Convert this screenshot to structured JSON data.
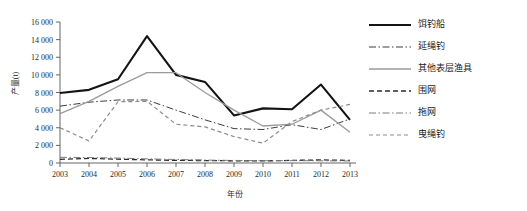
{
  "chart_data": {
    "type": "line",
    "title": "",
    "xlabel": "年份",
    "ylabel": "产量(t)",
    "grid": false,
    "legend_position": "right",
    "xlim": [
      2003,
      2013
    ],
    "ylim": [
      0,
      16000
    ],
    "ytick_step": 2000,
    "categories": [
      "2003",
      "2004",
      "2005",
      "2006",
      "2007",
      "2008",
      "2009",
      "2010",
      "2011",
      "2012",
      "2013"
    ],
    "ytick_labels": [
      "0",
      "2 000",
      "4 000",
      "6 000",
      "8 000",
      "10 000",
      "12 000",
      "14 000",
      "16 000"
    ],
    "series": [
      {
        "name": "饵钓船",
        "style": "solid",
        "color": "#141414",
        "width": 2.1,
        "values": [
          7950,
          8300,
          9500,
          14400,
          10000,
          9200,
          5400,
          6200,
          6100,
          8900,
          4900
        ]
      },
      {
        "name": "延绳钓",
        "style": "dashdot",
        "color": "#3c3c3c",
        "width": 1.0,
        "values": [
          6450,
          6900,
          7150,
          7150,
          6000,
          4900,
          3900,
          3800,
          4350,
          3800,
          5000
        ]
      },
      {
        "name": "其他表层渔具",
        "style": "solid",
        "color": "#9a9a9a",
        "width": 1.3,
        "values": [
          5600,
          7000,
          8700,
          10250,
          10250,
          8000,
          6000,
          4200,
          4400,
          6000,
          3500
        ]
      },
      {
        "name": "围网",
        "style": "dashed",
        "color": "#2b2b2b",
        "width": 1.3,
        "values": [
          420,
          520,
          430,
          360,
          300,
          280,
          250,
          230,
          300,
          350,
          300
        ]
      },
      {
        "name": "拖网",
        "style": "dashdot",
        "color": "#7d7d7d",
        "width": 1.0,
        "values": [
          640,
          620,
          560,
          470,
          400,
          330,
          290,
          260,
          270,
          250,
          230
        ]
      },
      {
        "name": "曳绳钓",
        "style": "dashed-light",
        "color": "#8c8c8c",
        "width": 1.2,
        "values": [
          4000,
          2500,
          6950,
          7000,
          4400,
          4100,
          3000,
          2250,
          4700,
          6000,
          6650
        ]
      }
    ]
  },
  "legend": {
    "items": [
      {
        "label": "饵钓船"
      },
      {
        "label": "延绳钓"
      },
      {
        "label": "其他表层渔具"
      },
      {
        "label": "围网"
      },
      {
        "label": "拖网"
      },
      {
        "label": "曳绳钓"
      }
    ]
  }
}
